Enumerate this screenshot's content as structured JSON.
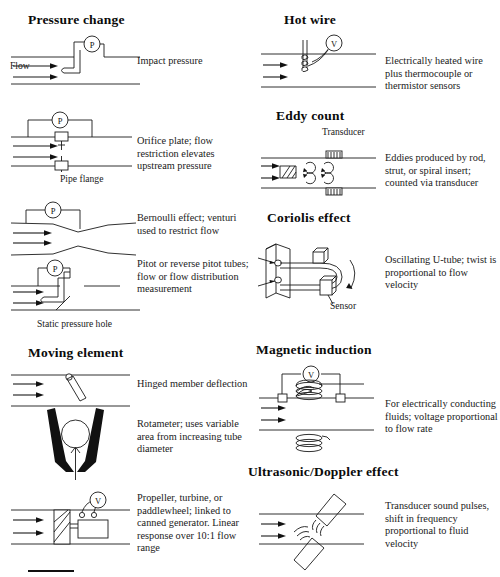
{
  "page": {
    "width": 500,
    "height": 577,
    "background": "#ffffff",
    "ink_color": "#1a1a1a"
  },
  "sections": {
    "pressure_change": {
      "heading": "Pressure change",
      "flow_label": "Flow",
      "items": [
        {
          "id": "impact-pressure",
          "caption": "Impact pressure",
          "gauge": "P",
          "annotation": ""
        },
        {
          "id": "orifice-plate",
          "caption": "Orifice plate; flow restriction elevates upstream pressure",
          "gauge": "P",
          "annotation": "Pipe flange"
        },
        {
          "id": "venturi",
          "caption": "Bernoulli effect; venturi used to restrict flow",
          "gauge": "P",
          "annotation": ""
        },
        {
          "id": "pitot-tube",
          "caption": "Pitot or reverse pitot tubes; flow or flow distribution measurement",
          "gauge": "P",
          "annotation": "Static pressure hole"
        }
      ]
    },
    "moving_element": {
      "heading": "Moving element",
      "items": [
        {
          "id": "hinged-member",
          "caption": "Hinged member deflection",
          "gauge": "",
          "annotation": ""
        },
        {
          "id": "rotameter",
          "caption": "Rotameter; uses variable area from increasing tube diameter",
          "gauge": "",
          "annotation": ""
        },
        {
          "id": "propeller-turbine",
          "caption": "Propeller, turbine, or paddlewheel; linked to canned generator. Linear response over 10:1 flow range",
          "gauge": "V",
          "annotation": ""
        }
      ]
    },
    "hot_wire": {
      "heading": "Hot wire",
      "items": [
        {
          "id": "hot-wire-probe",
          "caption": "Electrically heated wire plus thermocouple or thermistor sensors",
          "gauge": "V",
          "annotation": ""
        }
      ]
    },
    "eddy_count": {
      "heading": "Eddy count",
      "items": [
        {
          "id": "eddy-shedder",
          "caption": "Eddies produced by rod, strut, or spiral insert; counted via transducer",
          "gauge": "",
          "annotation": "Transducer"
        }
      ]
    },
    "coriolis_effect": {
      "heading": "Coriolis effect",
      "items": [
        {
          "id": "oscillating-u-tube",
          "caption": "Oscillating U-tube; twist is proportional to flow velocity",
          "gauge": "",
          "annotation": "Sensor"
        }
      ]
    },
    "magnetic_induction": {
      "heading": "Magnetic induction",
      "items": [
        {
          "id": "magnetic-flowmeter",
          "caption": "For electrically conducting fluids; voltage proportional to flow rate",
          "gauge": "V",
          "annotation": ""
        }
      ]
    },
    "ultrasonic_doppler": {
      "heading": "Ultrasonic/Doppler effect",
      "items": [
        {
          "id": "ultrasonic-transducer",
          "caption": "Transducer sound pulses, shift in frequency proportional to fluid velocity",
          "gauge": "",
          "annotation": ""
        }
      ]
    }
  }
}
